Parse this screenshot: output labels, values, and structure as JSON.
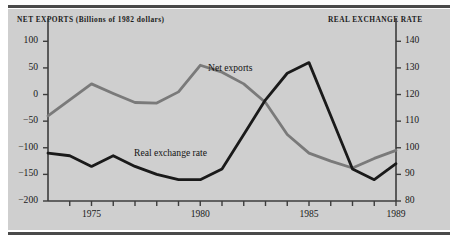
{
  "figure": {
    "background": "#cfcfcf",
    "page_background": "#ffffff",
    "rule_color": "#4a4a4a"
  },
  "titles": {
    "left_axis": "NET EXPORTS (Billions of 1982 dollars)",
    "right_axis": "REAL EXCHANGE RATE"
  },
  "series_labels": {
    "net_exports": "Net exports",
    "real_exchange_rate": "Real exchange rate"
  },
  "axes": {
    "left_ticks": [
      "100",
      "50",
      "0",
      "−50",
      "−100",
      "−150",
      "−200"
    ],
    "right_ticks": [
      "140",
      "130",
      "120",
      "110",
      "100",
      "90",
      "80"
    ],
    "x_ticks": [
      "1975",
      "1980",
      "1985",
      "1989"
    ]
  },
  "colors": {
    "net_exports_line": "#7a7a7a",
    "real_exchange_rate_line": "#1a1a1a",
    "axis": "#3c3c3c",
    "text": "#1a1a1a"
  },
  "chart_data": {
    "type": "line",
    "title": "",
    "xlabel": "",
    "ylabel": "NET EXPORTS (Billions of 1982 dollars)",
    "y2label": "REAL EXCHANGE RATE",
    "grid": false,
    "legend": "inline-annotations",
    "x": [
      1973,
      1974,
      1975,
      1976,
      1977,
      1978,
      1979,
      1980,
      1981,
      1982,
      1983,
      1984,
      1985,
      1986,
      1987,
      1988,
      1989
    ],
    "xlim": [
      1973,
      1989
    ],
    "ylim": [
      -200,
      125
    ],
    "y2lim": [
      80,
      145
    ],
    "series": [
      {
        "name": "Net exports",
        "axis": "left",
        "units": "Billions of 1982 dollars",
        "color": "#7a7a7a",
        "values": [
          -40,
          -10,
          20,
          2,
          -15,
          -16,
          5,
          55,
          42,
          20,
          -15,
          -75,
          -110,
          -125,
          -138,
          -120,
          -105
        ]
      },
      {
        "name": "Real exchange rate",
        "axis": "right",
        "units": "index",
        "color": "#1a1a1a",
        "values": [
          98,
          97,
          93,
          97,
          93,
          90,
          88,
          88,
          92,
          105,
          118,
          128,
          132,
          112,
          92,
          88,
          94
        ]
      }
    ]
  }
}
